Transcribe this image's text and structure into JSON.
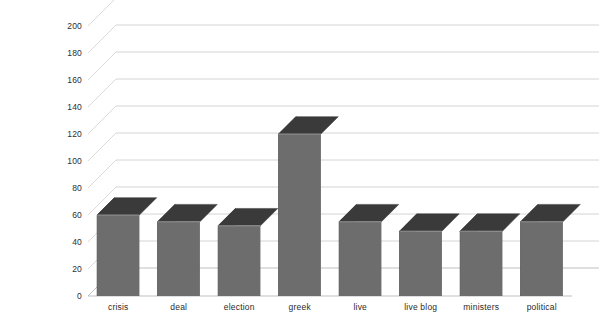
{
  "chart_data": {
    "type": "bar",
    "title": "",
    "subtitle": "",
    "xlabel": "",
    "ylabel": "",
    "categories": [
      "crisis",
      "deal",
      "election",
      "greek",
      "live",
      "live blog",
      "ministers",
      "political"
    ],
    "values": [
      60,
      55,
      52,
      120,
      55,
      48,
      48,
      55
    ],
    "series": [
      {
        "name": "frequency",
        "values": [
          60,
          55,
          52,
          120,
          55,
          48,
          48,
          55
        ]
      }
    ],
    "ylim": [
      0,
      200
    ],
    "ytick_labels": [
      "200",
      "180",
      "160",
      "140",
      "120",
      "100",
      "80",
      "60",
      "40",
      "20",
      "0"
    ],
    "ytick_values": [
      200,
      180,
      160,
      140,
      120,
      100,
      80,
      60,
      40,
      20,
      0
    ],
    "ytick_step": 20,
    "grid": true,
    "grid_axis": "y",
    "legend": false,
    "legend_position": "none",
    "projection": "3d-perspective",
    "annotations": [],
    "colors": {
      "background": "#ffffff",
      "bar_front": "#6d6d6d",
      "bar_top": "#3a3a3a",
      "bar_side": "#2f2f2f",
      "bar_edge": "#9a9a9a",
      "gridline": "#c9c9c9",
      "gridline_depth": "#d2d2d2",
      "baseline": "#b8b8b8",
      "tick_text": "#2e2e2e",
      "category_text": "#2b2b2b"
    }
  }
}
